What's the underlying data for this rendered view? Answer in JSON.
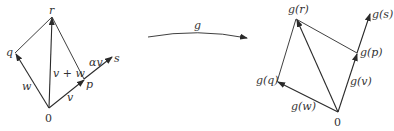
{
  "diagram": {
    "stroke_color": "#2a2a2a",
    "left": {
      "origin_label": "0",
      "labels": {
        "r": "r",
        "q": "q",
        "w": "w",
        "v": "v",
        "v_plus_w": "v + w",
        "p": "p",
        "alpha_v": "αv",
        "s": "s"
      }
    },
    "map": {
      "label": "g"
    },
    "right": {
      "origin_label": "0",
      "labels": {
        "g_r": "g(r)",
        "g_s": "g(s)",
        "g_p": "g(p)",
        "g_q": "g(q)",
        "g_v": "g(v)",
        "g_w": "g(w)"
      }
    }
  }
}
